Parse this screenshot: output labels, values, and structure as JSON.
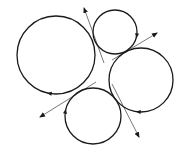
{
  "diagram": {
    "width": 186,
    "height": 164,
    "background": "#ffffff",
    "stroke_color": "#1a1a1a",
    "line_color": "#555555",
    "circles": [
      {
        "name": "large-circle",
        "cx": 56,
        "cy": 55,
        "r": 39,
        "arrow_angle": 100
      },
      {
        "name": "top-small-circle",
        "cx": 115,
        "cy": 32,
        "r": 22,
        "arrow_angle": 10
      },
      {
        "name": "right-circle",
        "cx": 141,
        "cy": 80,
        "r": 32,
        "arrow_angle": 95
      },
      {
        "name": "bottom-circle",
        "cx": 93,
        "cy": 116,
        "r": 28,
        "arrow_angle": 190
      }
    ],
    "tangent_lines": [
      {
        "name": "tangent-top-left",
        "x1": 104,
        "y1": 63,
        "x2": 84,
        "y2": 8
      },
      {
        "name": "tangent-top-right",
        "x1": 112,
        "y1": 60,
        "x2": 157,
        "y2": 33
      },
      {
        "name": "tangent-bottom-left",
        "x1": 96,
        "y1": 82,
        "x2": 40,
        "y2": 117
      },
      {
        "name": "tangent-bottom-right",
        "x1": 112,
        "y1": 84,
        "x2": 139,
        "y2": 137
      }
    ]
  }
}
